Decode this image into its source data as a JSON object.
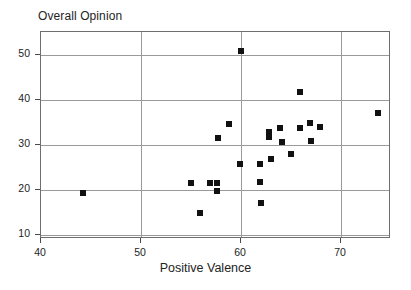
{
  "chart_data": {
    "type": "scatter",
    "title": "Overall Opinion",
    "xlabel": "Positive Valence",
    "ylabel": "Overall Opinion",
    "xlim": [
      40,
      75
    ],
    "ylim": [
      9,
      55
    ],
    "xticks": [
      40,
      50,
      60,
      70
    ],
    "yticks": [
      10,
      20,
      30,
      40,
      50
    ],
    "xticklabels": [
      "40",
      "50",
      "60",
      "70"
    ],
    "yticklabels": [
      "10",
      "20",
      "30",
      "40",
      "50"
    ],
    "grid": true,
    "legend": null,
    "marker_style": "filled-square",
    "marker_color": "#111111",
    "points": [
      {
        "x": 44.2,
        "y": 19.2
      },
      {
        "x": 55.0,
        "y": 21.4
      },
      {
        "x": 55.9,
        "y": 14.7
      },
      {
        "x": 56.9,
        "y": 21.4
      },
      {
        "x": 57.6,
        "y": 21.5
      },
      {
        "x": 57.6,
        "y": 19.6
      },
      {
        "x": 57.7,
        "y": 31.4
      },
      {
        "x": 58.8,
        "y": 34.5
      },
      {
        "x": 60.0,
        "y": 50.7
      },
      {
        "x": 59.9,
        "y": 25.7
      },
      {
        "x": 61.9,
        "y": 25.7
      },
      {
        "x": 61.9,
        "y": 21.6
      },
      {
        "x": 62.0,
        "y": 16.9
      },
      {
        "x": 62.8,
        "y": 32.8
      },
      {
        "x": 62.8,
        "y": 31.7
      },
      {
        "x": 63.0,
        "y": 26.8
      },
      {
        "x": 63.9,
        "y": 33.7
      },
      {
        "x": 64.1,
        "y": 30.6
      },
      {
        "x": 65.0,
        "y": 27.9
      },
      {
        "x": 65.9,
        "y": 41.6
      },
      {
        "x": 65.9,
        "y": 33.7
      },
      {
        "x": 66.9,
        "y": 34.7
      },
      {
        "x": 67.0,
        "y": 30.8
      },
      {
        "x": 67.9,
        "y": 33.8
      },
      {
        "x": 73.7,
        "y": 37.0
      }
    ]
  }
}
